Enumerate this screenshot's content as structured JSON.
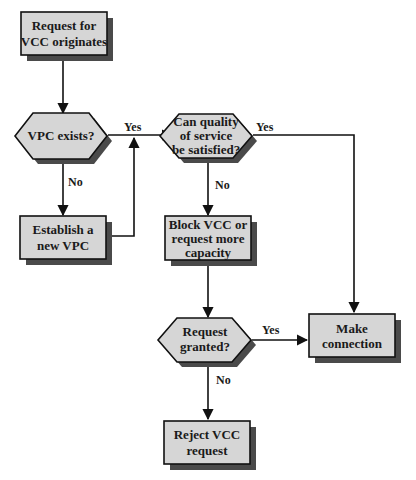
{
  "colors": {
    "node_fill": "#d6d6d6",
    "node_shadow": "#4a4a4a",
    "stroke": "#111111",
    "background": "#ffffff"
  },
  "nodes": {
    "request_originates": {
      "type": "process",
      "lines": [
        "Request for",
        "VCC originates"
      ]
    },
    "vpc_exists": {
      "type": "decision",
      "lines": [
        "VPC exists?"
      ]
    },
    "establish_vpc": {
      "type": "process",
      "lines": [
        "Establish a",
        "new VPC"
      ]
    },
    "qos_satisfied": {
      "type": "decision",
      "lines": [
        "Can quality",
        "of service",
        "be satisfied?"
      ]
    },
    "block_vcc": {
      "type": "process",
      "lines": [
        "Block VCC or",
        "request more",
        "capacity"
      ]
    },
    "request_granted": {
      "type": "decision",
      "lines": [
        "Request",
        "granted?"
      ]
    },
    "make_connection": {
      "type": "process",
      "lines": [
        "Make",
        "connection"
      ]
    },
    "reject_vcc": {
      "type": "process",
      "lines": [
        "Reject VCC",
        "request"
      ]
    }
  },
  "edges": {
    "vpc_yes": "Yes",
    "vpc_no": "No",
    "qos_yes": "Yes",
    "qos_no": "No",
    "granted_yes": "Yes",
    "granted_no": "No"
  }
}
